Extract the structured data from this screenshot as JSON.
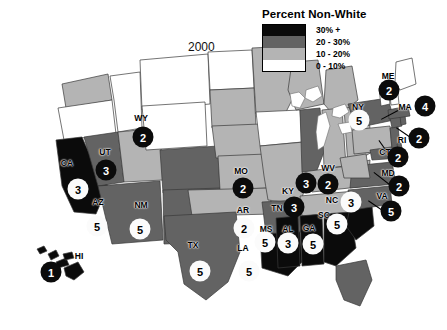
{
  "title_year": "2000",
  "legend": {
    "title": "Percent Non-White",
    "entries": [
      {
        "label": "30% +",
        "color": "#0b0b0b"
      },
      {
        "label": "20 - 30%",
        "color": "#636363"
      },
      {
        "label": "10 - 20%",
        "color": "#b4b4b4"
      },
      {
        "label": "0 - 10%",
        "color": "#ffffff"
      }
    ]
  },
  "map": {
    "states": [
      {
        "code": "CA",
        "abbr": "CA",
        "tier": 0,
        "abbr_x": 67,
        "abbr_y": 163,
        "marker": {
          "value": "3",
          "style": "light",
          "x": 78,
          "y": 189
        }
      },
      {
        "code": "UT",
        "abbr": "UT",
        "tier": 2,
        "abbr_x": 105,
        "abbr_y": 152,
        "marker": {
          "value": "3",
          "style": "dark",
          "x": 106,
          "y": 170
        }
      },
      {
        "code": "WY",
        "abbr": "WY",
        "tier": 3,
        "abbr_x": 141,
        "abbr_y": 118,
        "marker": {
          "value": "2",
          "style": "dark",
          "x": 143,
          "y": 137
        }
      },
      {
        "code": "AZ",
        "abbr": "AZ",
        "tier": 1,
        "abbr_x": 98,
        "abbr_y": 202,
        "marker": {
          "value": "5",
          "style": "light",
          "x": 97,
          "y": 226
        }
      },
      {
        "code": "NM",
        "abbr": "NM",
        "tier": 1,
        "abbr_x": 141,
        "abbr_y": 205,
        "marker": {
          "value": "5",
          "style": "light",
          "x": 140,
          "y": 229
        }
      },
      {
        "code": "TX",
        "abbr": "TX",
        "tier": 1,
        "abbr_x": 193,
        "abbr_y": 245,
        "marker": {
          "value": "5",
          "style": "light",
          "x": 200,
          "y": 271
        }
      },
      {
        "code": "HI",
        "abbr": "HI",
        "tier": 0,
        "abbr_x": 79,
        "abbr_y": 256,
        "marker": {
          "value": "1",
          "style": "dark",
          "x": 51,
          "y": 272
        }
      },
      {
        "code": "MO",
        "abbr": "MO",
        "tier": 2,
        "abbr_x": 241,
        "abbr_y": 171,
        "marker": {
          "value": "2",
          "style": "dark",
          "x": 243,
          "y": 188
        }
      },
      {
        "code": "AR",
        "abbr": "AR",
        "tier": 1,
        "abbr_x": 243,
        "abbr_y": 210,
        "marker": {
          "value": "2",
          "style": "light",
          "x": 244,
          "y": 228
        }
      },
      {
        "code": "LA",
        "abbr": "LA",
        "tier": 0,
        "abbr_x": 243,
        "abbr_y": 248,
        "marker": {
          "value": "5",
          "style": "light",
          "x": 249,
          "y": 271
        }
      },
      {
        "code": "MS",
        "abbr": "MS",
        "tier": 0,
        "abbr_x": 266,
        "abbr_y": 229,
        "marker": {
          "value": "5",
          "style": "light",
          "x": 265,
          "y": 242
        }
      },
      {
        "code": "AL",
        "abbr": "AL",
        "tier": 0,
        "abbr_x": 288,
        "abbr_y": 229,
        "marker": {
          "value": "3",
          "style": "light",
          "x": 288,
          "y": 243
        }
      },
      {
        "code": "GA",
        "abbr": "GA",
        "tier": 0,
        "abbr_x": 309,
        "abbr_y": 228,
        "marker": {
          "value": "5",
          "style": "light",
          "x": 313,
          "y": 244
        }
      },
      {
        "code": "SC",
        "abbr": "SC",
        "tier": 0,
        "abbr_x": 324,
        "abbr_y": 215,
        "marker": {
          "value": "5",
          "style": "light",
          "x": 337,
          "y": 224
        }
      },
      {
        "code": "NC",
        "abbr": "NC",
        "tier": 1,
        "abbr_x": 332,
        "abbr_y": 200,
        "marker": {
          "value": "3",
          "style": "light",
          "x": 351,
          "y": 202
        }
      },
      {
        "code": "TN",
        "abbr": "TN",
        "tier": 2,
        "abbr_x": 277,
        "abbr_y": 208,
        "marker": {
          "value": "3",
          "style": "dark",
          "x": 294,
          "y": 207
        }
      },
      {
        "code": "KY",
        "abbr": "KY",
        "tier": 2,
        "abbr_x": 288,
        "abbr_y": 191,
        "marker": {
          "value": "3",
          "style": "dark",
          "x": 306,
          "y": 183
        }
      },
      {
        "code": "WV",
        "abbr": "WV",
        "tier": 2,
        "abbr_x": 328,
        "abbr_y": 168,
        "marker": {
          "value": "2",
          "style": "dark",
          "x": 328,
          "y": 184
        }
      },
      {
        "code": "NY",
        "abbr": "NY",
        "tier": 1,
        "abbr_x": 358,
        "abbr_y": 107,
        "marker": {
          "value": "5",
          "style": "light",
          "x": 359,
          "y": 120
        }
      },
      {
        "code": "ME",
        "abbr": "ME",
        "tier": 3,
        "abbr_x": 388,
        "abbr_y": 76,
        "marker": {
          "value": "2",
          "style": "dark",
          "x": 389,
          "y": 90
        }
      },
      {
        "code": "MA",
        "abbr": "MA",
        "tier": 1,
        "abbr_x": 405,
        "abbr_y": 107,
        "marker": {
          "value": "4",
          "style": "dark",
          "x": 425,
          "y": 106
        }
      },
      {
        "code": "RI",
        "abbr": "RI",
        "tier": 1,
        "abbr_x": 402,
        "abbr_y": 140,
        "marker": {
          "value": "2",
          "style": "dark",
          "x": 419,
          "y": 138
        }
      },
      {
        "code": "CT",
        "abbr": "CT",
        "tier": 1,
        "abbr_x": 385,
        "abbr_y": 152,
        "marker": {
          "value": "2",
          "style": "dark",
          "x": 398,
          "y": 157
        }
      },
      {
        "code": "MD",
        "abbr": "MD",
        "tier": 1,
        "abbr_x": 388,
        "abbr_y": 173,
        "marker": {
          "value": "2",
          "style": "dark",
          "x": 399,
          "y": 186
        }
      },
      {
        "code": "VA",
        "abbr": "VA",
        "tier": 1,
        "abbr_x": 382,
        "abbr_y": 196,
        "marker": {
          "value": "5",
          "style": "dark",
          "x": 391,
          "y": 211
        }
      }
    ]
  }
}
